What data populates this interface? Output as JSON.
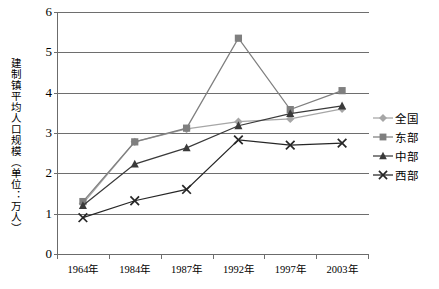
{
  "chart_data": {
    "type": "line",
    "title": "",
    "xlabel": "",
    "ylabel": "建制镇平均人口规模（单位：万人）",
    "categories": [
      "1964年",
      "1984年",
      "1987年",
      "1992年",
      "1997年",
      "2003年"
    ],
    "ylim": [
      0,
      6
    ],
    "yticks": [
      "0",
      "1",
      "2",
      "3",
      "4",
      "5",
      "6"
    ],
    "grid": true,
    "legend_position": "right",
    "series": [
      {
        "name": "全国",
        "marker": "diamond",
        "color": "#a6a6a6",
        "values": [
          1.25,
          2.78,
          3.1,
          3.28,
          3.35,
          3.6
        ]
      },
      {
        "name": "东部",
        "marker": "square",
        "color": "#7f7f7f",
        "values": [
          1.3,
          2.78,
          3.12,
          5.35,
          3.58,
          4.05
        ]
      },
      {
        "name": "中部",
        "marker": "triangle",
        "color": "#3a3a3a",
        "values": [
          1.2,
          2.23,
          2.63,
          3.18,
          3.48,
          3.67
        ]
      },
      {
        "name": "西部",
        "marker": "x",
        "color": "#262626",
        "values": [
          0.9,
          1.32,
          1.6,
          2.83,
          2.7,
          2.75
        ]
      }
    ]
  },
  "axis": {
    "y_title": "建制镇平均人口规模（单位：万人）"
  },
  "legend": {
    "items": [
      {
        "label": "全国",
        "icon": "diamond-marker-icon"
      },
      {
        "label": "东部",
        "icon": "square-marker-icon"
      },
      {
        "label": "中部",
        "icon": "triangle-marker-icon"
      },
      {
        "label": "西部",
        "icon": "x-marker-icon"
      }
    ]
  }
}
